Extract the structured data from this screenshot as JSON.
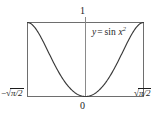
{
  "figure": {
    "title": "",
    "equation_label": "y = sin x²",
    "equation_parts": {
      "lhs": "y",
      "equals": "=",
      "func": "sin",
      "arg_base": "x",
      "arg_exponent": "2"
    },
    "y_top_label": "1",
    "origin_label": "0",
    "x_left_label": "−√(π/2)",
    "x_right_label": "√(π/2)",
    "x_left_parts": {
      "sign": "−",
      "radical": "√",
      "radicand": "π/2"
    },
    "x_right_parts": {
      "sign": "",
      "radical": "√",
      "radicand": "π/2"
    },
    "colors": {
      "curve": "#3a3a3a",
      "frame": "#6e6e6e",
      "axis": "#8a8a8a",
      "text": "#1c1c1c",
      "background": "#ffffff"
    }
  },
  "chart_data": {
    "type": "line",
    "title": "",
    "xlabel": "",
    "ylabel": "",
    "function": "y = sin(x^2)",
    "xlim": [
      -1.2533141373155001,
      1.2533141373155001
    ],
    "ylim": [
      0,
      1
    ],
    "xtick_labels": [
      "−√(π/2)",
      "0",
      "√(π/2)"
    ],
    "xtick_values": [
      -1.2533141373155001,
      0,
      1.2533141373155001
    ],
    "ytick_labels": [
      "0",
      "1"
    ],
    "ytick_values": [
      0,
      1
    ],
    "grid": false,
    "legend": false,
    "annotations": [
      {
        "text": "y = sin x²",
        "x": 0.45,
        "y": 0.82
      },
      {
        "text": "1",
        "x": 0,
        "y": 1.08
      },
      {
        "text": "0",
        "x": 0,
        "y": -0.09
      }
    ],
    "series": [
      {
        "name": "y = sin(x^2)",
        "x": [
          -1.2533141,
          -1.1906484,
          -1.1279827,
          -1.065317,
          -1.0026513,
          -0.9399856,
          -0.8773199,
          -0.8146542,
          -0.7519885,
          -0.6893228,
          -0.6266571,
          -0.5639914,
          -0.5013257,
          -0.4386599,
          -0.3759942,
          -0.3133285,
          -0.2506628,
          -0.1879971,
          -0.1253314,
          -0.0626657,
          0.0,
          0.0626657,
          0.1253314,
          0.1879971,
          0.2506628,
          0.3133285,
          0.3759942,
          0.4386599,
          0.5013257,
          0.5639914,
          0.6266571,
          0.6893228,
          0.7519885,
          0.8146542,
          0.8773199,
          0.9399856,
          1.0026513,
          1.065317,
          1.1279827,
          1.1906484,
          1.2533141
        ],
        "y": [
          1.0,
          0.9504,
          0.8776,
          0.7855,
          0.679,
          0.5638,
          0.4459,
          0.3311,
          0.2246,
          0.1309,
          0.0531,
          0.0,
          0.0,
          0.0,
          0.0,
          0.0,
          0.0,
          0.0,
          0.0,
          0.0,
          0.0,
          0.0,
          0.0,
          0.0,
          0.0,
          0.0,
          0.0,
          0.0,
          0.0,
          0.0,
          0.0531,
          0.1309,
          0.2246,
          0.3311,
          0.4459,
          0.5638,
          0.679,
          0.7855,
          0.8776,
          0.9504,
          1.0
        ]
      }
    ]
  }
}
